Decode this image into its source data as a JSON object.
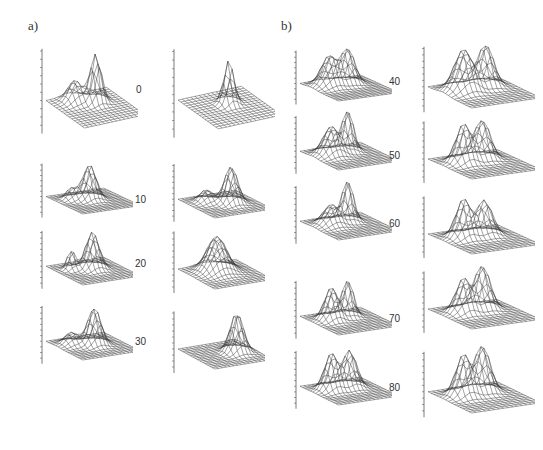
{
  "figure": {
    "panel_a_label": "a)",
    "panel_b_label": "b)",
    "left_axis_label": "pH in situ",
    "right_axis_label": "[O2] ml/lg",
    "x_axis_label": "longitude",
    "y_axis_label": "latitude"
  },
  "chart_data": {
    "type": "surface",
    "title": "",
    "panels": [
      {
        "panel": "a",
        "depths": [
          0,
          10,
          20,
          30
        ]
      },
      {
        "panel": "b",
        "depths": [
          40,
          50,
          60,
          70,
          80
        ]
      }
    ],
    "depth_labels": [
      "0",
      "10",
      "20",
      "30",
      "40",
      "50",
      "60",
      "70",
      "80"
    ],
    "variables": [
      "pH in situ",
      "[O2] ml/l"
    ],
    "x_ticks": [
      "3",
      "3'20",
      "3'40"
    ],
    "y_ticks": [
      "40'20",
      "40'40"
    ],
    "ph_ticks_example": [
      "8.22",
      "8.24",
      "8.26"
    ],
    "o2_ticks_example": [
      "5.41",
      "5.51",
      "5.62"
    ]
  }
}
